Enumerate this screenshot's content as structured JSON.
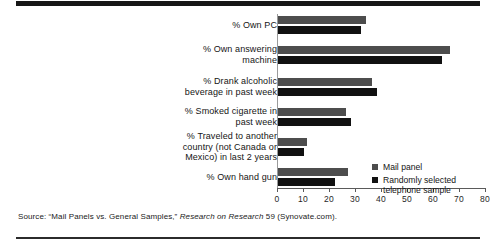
{
  "chart_data": {
    "type": "bar",
    "orientation": "horizontal",
    "title": "",
    "xlabel": "",
    "ylabel": "",
    "xlim": [
      0,
      80
    ],
    "xticks": [
      0,
      10,
      20,
      30,
      40,
      50,
      60,
      70,
      80
    ],
    "grid": false,
    "legend_position": "inside-right",
    "categories": [
      "% Own PC",
      "% Own answering machine",
      "% Drank alcoholic beverage in past week",
      "% Smoked cigarette in past week",
      "% Traveled to another country (not Canada or Mexico) in last 2 years",
      "% Own hand gun"
    ],
    "category_lines": [
      [
        "% Own PC"
      ],
      [
        "% Own answering",
        "machine"
      ],
      [
        "% Drank alcoholic",
        "beverage in past week"
      ],
      [
        "% Smoked cigarette in",
        "past week"
      ],
      [
        "% Traveled to another",
        "country (not Canada or",
        "Mexico) in last 2 years"
      ],
      [
        "% Own hand gun"
      ]
    ],
    "series": [
      {
        "name": "Mail panel",
        "color": "#4d4d4d",
        "values": [
          34,
          66,
          36,
          26,
          11,
          27
        ]
      },
      {
        "name": "Randomly selected telephone sample",
        "color": "#111111",
        "values": [
          32,
          63,
          38,
          28,
          10,
          22
        ]
      }
    ]
  },
  "legend": {
    "items": [
      {
        "label": "Mail panel",
        "label_lines": [
          "Mail panel"
        ],
        "color": "#4d4d4d"
      },
      {
        "label": "Randomly selected telephone sample",
        "label_lines": [
          "Randomly selected",
          "telephone sample"
        ],
        "color": "#111111"
      }
    ]
  },
  "source": {
    "prefix": "Source: “Mail Panels vs. General Samples,” ",
    "italic": "Research on Research",
    "suffix": " 59 (Synovate.com)."
  }
}
